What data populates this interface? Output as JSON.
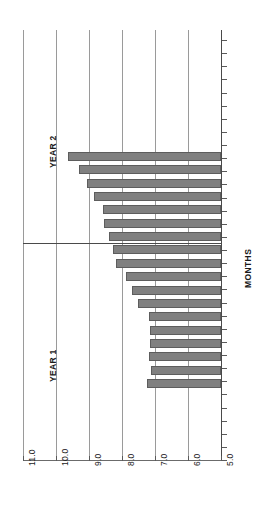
{
  "chart_data": {
    "type": "bar",
    "orientation": "horizontal",
    "title": "",
    "subtitle": "",
    "xlabel": "MONTHS",
    "ylabel": "",
    "value_axis_label": "",
    "category_axis_label": "MONTHS",
    "grid": true,
    "legend_position": "none",
    "xlim": [
      5.0,
      11.0
    ],
    "baseline": 5.0,
    "tick_labels": [
      "11.0",
      "10.0",
      "9.0",
      "8.0",
      "7.0",
      "6.0",
      "5.0"
    ],
    "tick_values": [
      11.0,
      10.0,
      9.0,
      8.0,
      7.0,
      6.0,
      5.0
    ],
    "categories": [
      "1",
      "2",
      "3",
      "4",
      "5",
      "6",
      "7",
      "8",
      "9",
      "10",
      "11",
      "12",
      "13",
      "14",
      "15",
      "16",
      "17",
      "18"
    ],
    "values": [
      9.63,
      9.29,
      9.05,
      8.84,
      8.58,
      8.55,
      8.39,
      8.28,
      8.18,
      7.88,
      7.69,
      7.52,
      7.19,
      7.15,
      7.15,
      7.18,
      7.12,
      7.23
    ],
    "groups": [
      {
        "name": "YEAR 2",
        "count": 5,
        "start_index": 0
      },
      {
        "name": "YEAR 1",
        "count": 13,
        "start_index": 5
      }
    ],
    "annotations": [
      "YEAR 2",
      "YEAR 1"
    ],
    "bar_color": "#808080",
    "bar_border_color": "#5d5d5d",
    "grid_color": "#9a9a9a",
    "axis_color": "#4a4a4a",
    "text_color": "#1a1a1a"
  },
  "axis": {
    "title": "MONTHS",
    "ticks": [
      "11.0",
      "10.0",
      "9.0",
      "8.0",
      "7.0",
      "6.0",
      "5.0"
    ]
  },
  "labels": {
    "year_2": "YEAR 2",
    "year_1": "YEAR 1"
  }
}
